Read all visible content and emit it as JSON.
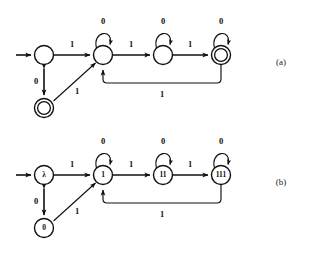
{
  "figure": {
    "background_color": "#ffffff",
    "stroke_color": "#101010",
    "width": 311,
    "height": 255,
    "panels": [
      {
        "id": "a",
        "caption": "(a)",
        "description": "finite automaton with unlabeled states",
        "states": [
          {
            "id": "a-start",
            "label": "",
            "shape": "circle",
            "accepting": false,
            "cx": 44,
            "cy": 55,
            "r": 9.5
          },
          {
            "id": "a-s1",
            "label": "",
            "shape": "circle",
            "accepting": false,
            "cx": 103,
            "cy": 55,
            "r": 9.5
          },
          {
            "id": "a-s2",
            "label": "",
            "shape": "circle",
            "accepting": false,
            "cx": 163,
            "cy": 55,
            "r": 9.5
          },
          {
            "id": "a-s3",
            "label": "",
            "shape": "double-circle",
            "accepting": true,
            "cx": 221,
            "cy": 55,
            "r": 9.5
          },
          {
            "id": "a-s0",
            "label": "",
            "shape": "double-circle",
            "accepting": true,
            "cx": 44,
            "cy": 108,
            "r": 9.5
          }
        ],
        "transitions": [
          {
            "from": "start-arrow",
            "to": "a-start",
            "symbol": "",
            "kind": "initial"
          },
          {
            "from": "a-start",
            "to": "a-s1",
            "symbol": "1",
            "kind": "straight"
          },
          {
            "from": "a-start",
            "to": "a-s0",
            "symbol": "0",
            "kind": "vertical-bidirectional"
          },
          {
            "from": "a-s0",
            "to": "a-s1",
            "symbol": "1",
            "kind": "diagonal"
          },
          {
            "from": "a-s1",
            "to": "a-s1",
            "symbol": "0",
            "kind": "self-loop"
          },
          {
            "from": "a-s1",
            "to": "a-s2",
            "symbol": "1",
            "kind": "straight"
          },
          {
            "from": "a-s2",
            "to": "a-s2",
            "symbol": "0",
            "kind": "self-loop"
          },
          {
            "from": "a-s2",
            "to": "a-s3",
            "symbol": "1",
            "kind": "straight"
          },
          {
            "from": "a-s3",
            "to": "a-s3",
            "symbol": "0",
            "kind": "self-loop"
          },
          {
            "from": "a-s3",
            "to": "a-s1",
            "symbol": "1",
            "kind": "feedback-below"
          }
        ]
      },
      {
        "id": "b",
        "caption": "(b)",
        "description": "same automaton with states labeled by representative strings",
        "states": [
          {
            "id": "b-lambda",
            "label": "λ",
            "shape": "circle",
            "accepting": false,
            "cx": 44,
            "cy": 175,
            "r": 9.5
          },
          {
            "id": "b-1",
            "label": "1",
            "shape": "circle",
            "accepting": false,
            "cx": 103,
            "cy": 175,
            "r": 9.5
          },
          {
            "id": "b-11",
            "label": "11",
            "shape": "circle",
            "accepting": false,
            "cx": 163,
            "cy": 175,
            "r": 9.5
          },
          {
            "id": "b-111",
            "label": "111",
            "shape": "circle",
            "accepting": false,
            "cx": 221,
            "cy": 175,
            "r": 9.5
          },
          {
            "id": "b-0",
            "label": "0",
            "shape": "circle",
            "accepting": false,
            "cx": 44,
            "cy": 228,
            "r": 9.5
          }
        ],
        "transitions": [
          {
            "from": "start-arrow",
            "to": "b-lambda",
            "symbol": "",
            "kind": "initial"
          },
          {
            "from": "b-lambda",
            "to": "b-1",
            "symbol": "1",
            "kind": "straight"
          },
          {
            "from": "b-lambda",
            "to": "b-0",
            "symbol": "0",
            "kind": "vertical-bidirectional"
          },
          {
            "from": "b-0",
            "to": "b-1",
            "symbol": "1",
            "kind": "diagonal"
          },
          {
            "from": "b-1",
            "to": "b-1",
            "symbol": "0",
            "kind": "self-loop"
          },
          {
            "from": "b-1",
            "to": "b-11",
            "symbol": "1",
            "kind": "straight"
          },
          {
            "from": "b-11",
            "to": "b-11",
            "symbol": "0",
            "kind": "self-loop"
          },
          {
            "from": "b-11",
            "to": "b-111",
            "symbol": "1",
            "kind": "straight"
          },
          {
            "from": "b-111",
            "to": "b-111",
            "symbol": "0",
            "kind": "self-loop"
          },
          {
            "from": "b-111",
            "to": "b-1",
            "symbol": "1",
            "kind": "feedback-below"
          }
        ]
      }
    ],
    "symbols": {
      "zero": "0",
      "one": "1",
      "lambda": "λ"
    },
    "labels": {
      "a_self_loop_1": "0",
      "a_self_loop_2": "0",
      "a_self_loop_3": "0",
      "a_edge_start_s1": "1",
      "a_edge_start_s0": "0",
      "a_edge_s0_s1": "1",
      "a_edge_s1_s2": "1",
      "a_edge_s2_s3": "1",
      "a_edge_feedback": "1",
      "b_self_loop_1": "0",
      "b_self_loop_2": "0",
      "b_self_loop_3": "0",
      "b_edge_lambda_1": "1",
      "b_edge_lambda_0": "0",
      "b_edge_0_1": "1",
      "b_edge_1_11": "1",
      "b_edge_11_111": "1",
      "b_edge_feedback": "1",
      "caption_a": "(a)",
      "caption_b": "(b)"
    }
  }
}
